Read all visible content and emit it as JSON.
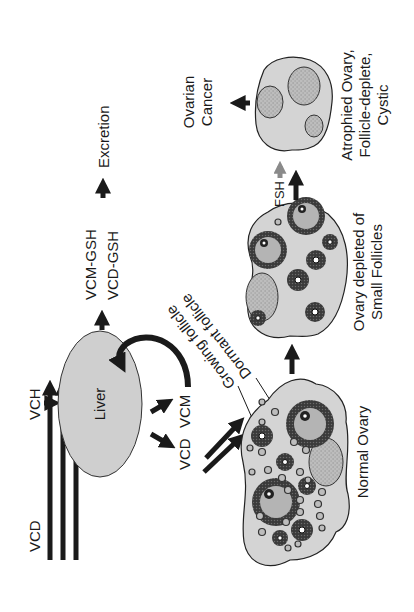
{
  "diagram": {
    "orientation": "rotated-90-ccw",
    "colors": {
      "ink": "#1a1a1a",
      "organ_fill": "#d4d4d4",
      "liver_fill": "#cfcfcf",
      "follicle_ring": "#2a2a2a",
      "antrum_fill": "#b4b4b4",
      "cyst_fill": "#bdbdbd",
      "fsh_arrow": "#8a8a8a"
    },
    "nodes": {
      "vcd_source": {
        "label": "VCD"
      },
      "vch_source": {
        "label": "VCH"
      },
      "liver": {
        "label": "Liver"
      },
      "vcd_metabolite": {
        "label": "VCD"
      },
      "vcm_metabolite": {
        "label": "VCM"
      },
      "conjugate_vcm": {
        "label": "VCM-GSH"
      },
      "conjugate_vcd": {
        "label": "VCD-GSH"
      },
      "excretion": {
        "label": "Excretion"
      },
      "growing_follicle": {
        "label": "Growing follicle"
      },
      "dormant_follicle": {
        "label": "Dormant follicle"
      },
      "normal_ovary": {
        "label": "Normal Ovary"
      },
      "depleted_ovary": {
        "label_line1": "Ovary depleted of",
        "label_line2": "Small Follicles"
      },
      "fsh": {
        "label": "FSH"
      },
      "atrophied_ovary": {
        "label_line1": "Atrophied Ovary,",
        "label_line2": "Follicle-deplete,",
        "label_line3": "Cystic"
      },
      "ovarian_cancer": {
        "label_line1": "Ovarian",
        "label_line2": "Cancer"
      }
    },
    "edges": [
      {
        "from": "VCD",
        "to": "Normal Ovary",
        "style": "triple-arrow"
      },
      {
        "from": "VCH",
        "to": "Liver"
      },
      {
        "from": "Liver",
        "to": "VCD"
      },
      {
        "from": "Liver",
        "to": "VCM"
      },
      {
        "from": "VCD",
        "to": "Normal Ovary",
        "style": "double-arrow"
      },
      {
        "from": "VCM",
        "to": "Liver",
        "style": "curved"
      },
      {
        "from": "Liver",
        "to": "VCM-GSH / VCD-GSH"
      },
      {
        "from": "VCM-GSH / VCD-GSH",
        "to": "Excretion"
      },
      {
        "from": "Normal Ovary",
        "to": "Ovary depleted of Small Follicles"
      },
      {
        "from": "Ovary depleted of Small Follicles",
        "to": "Atrophied Ovary, Follicle-deplete, Cystic"
      },
      {
        "from": "FSH",
        "to": "Atrophied Ovary",
        "style": "gray-small"
      },
      {
        "from": "Atrophied Ovary",
        "to": "Ovarian Cancer"
      }
    ]
  }
}
